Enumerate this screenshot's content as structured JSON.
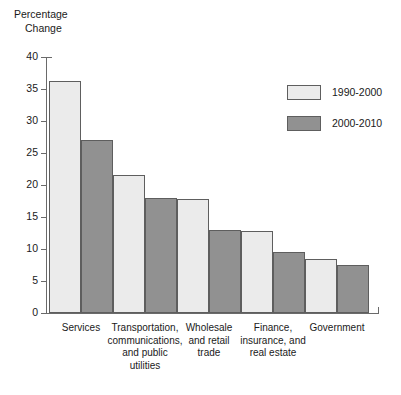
{
  "chart_data": {
    "type": "bar",
    "title": "",
    "ylabel": "Percentage Change",
    "ylabel_line1": "Percentage",
    "ylabel_line2": "Change",
    "xlabel": "",
    "ylim": [
      0,
      40
    ],
    "ytick_step": 5,
    "yticks": [
      "40",
      "35",
      "30",
      "25",
      "20",
      "15",
      "10",
      "5",
      "0"
    ],
    "ytick_values": [
      40,
      35,
      30,
      25,
      20,
      15,
      10,
      5,
      0
    ],
    "grid": false,
    "legend_position": "upper-right",
    "categories": [
      "Services",
      "Transportation, communications, and public utilities",
      "Wholesale and retail trade",
      "Finance, insurance, and real estate",
      "Government"
    ],
    "category_label_lines": [
      [
        "Services"
      ],
      [
        "Transportation,",
        "communications,",
        "and public",
        "utilities"
      ],
      [
        "Wholesale",
        "and retail",
        "trade"
      ],
      [
        "Finance,",
        "insurance, and",
        "real estate"
      ],
      [
        "Government"
      ]
    ],
    "series": [
      {
        "name": "1990-2000",
        "color": "#ebebeb",
        "values": [
          36.2,
          21.5,
          17.8,
          12.8,
          8.5
        ]
      },
      {
        "name": "2000-2010",
        "color": "#919191",
        "values": [
          27.0,
          18.0,
          12.9,
          9.5,
          7.5
        ]
      }
    ]
  },
  "legend": {
    "items": [
      {
        "label": "1990-2000",
        "swatch": "series-a"
      },
      {
        "label": "2000-2010",
        "swatch": "series-b"
      }
    ]
  }
}
